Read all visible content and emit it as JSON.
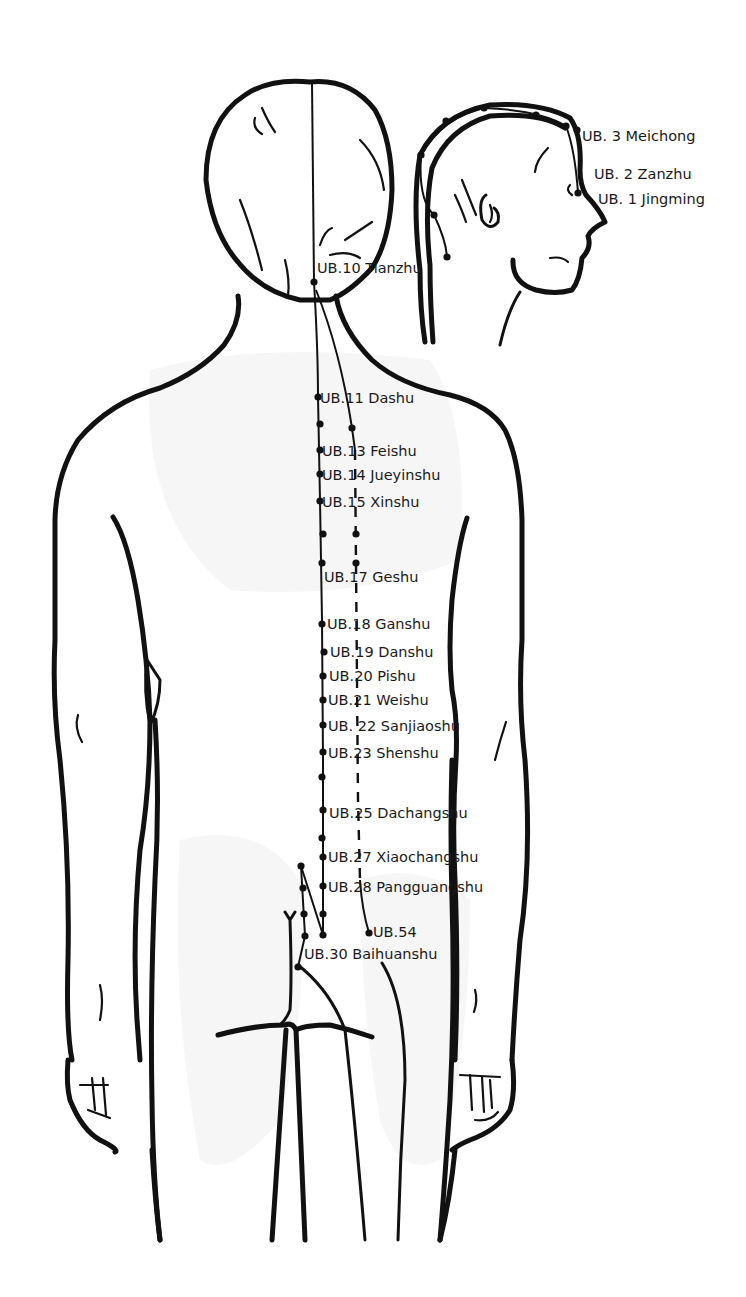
{
  "diagram": {
    "colors": {
      "line": "#111111",
      "background": "#ffffff",
      "shading": "#efefef"
    },
    "head_labels": [
      {
        "id": "ub3",
        "text": "UB. 3 Meichong",
        "x": 582,
        "y": 141,
        "px": 577,
        "py": 130
      },
      {
        "id": "ub2",
        "text": "UB. 2 Zanzhu",
        "x": 594,
        "y": 179
      },
      {
        "id": "ub1",
        "text": "UB. 1 Jingming",
        "x": 598,
        "y": 204,
        "px": 578,
        "py": 193
      }
    ],
    "back_labels": [
      {
        "id": "ub10",
        "text": "UB.10 Tianzhu",
        "x": 317,
        "y": 273,
        "px": 314,
        "py": 282
      },
      {
        "id": "ub11",
        "text": "UB.11 Dashu",
        "x": 320,
        "y": 403,
        "px": 318,
        "py": 397
      },
      {
        "id": "ub13",
        "text": "UB.13 Feishu",
        "x": 322,
        "y": 456,
        "px": 320,
        "py": 450
      },
      {
        "id": "ub14",
        "text": "UB.14 Jueyinshu",
        "x": 322,
        "y": 480,
        "px": 320,
        "py": 474
      },
      {
        "id": "ub15",
        "text": "UB.15 Xinshu",
        "x": 322,
        "y": 507,
        "px": 320,
        "py": 501
      },
      {
        "id": "ub17",
        "text": "UB.17 Geshu",
        "x": 324,
        "y": 582,
        "px": 322,
        "py": 563
      },
      {
        "id": "ub18",
        "text": "UB.18 Ganshu",
        "x": 327,
        "y": 629,
        "px": 322,
        "py": 624
      },
      {
        "id": "ub19",
        "text": "UB.19 Danshu",
        "x": 330,
        "y": 657,
        "px": 324,
        "py": 652
      },
      {
        "id": "ub20",
        "text": "UB.20 Pishu",
        "x": 329,
        "y": 681,
        "px": 323,
        "py": 676
      },
      {
        "id": "ub21",
        "text": "UB.21 Weishu",
        "x": 328,
        "y": 705,
        "px": 323,
        "py": 700
      },
      {
        "id": "ub22",
        "text": "UB. 22 Sanjiaoshu",
        "x": 328,
        "y": 731,
        "px": 323,
        "py": 725
      },
      {
        "id": "ub23",
        "text": "UB.23 Shenshu",
        "x": 328,
        "y": 758,
        "px": 323,
        "py": 752
      },
      {
        "id": "ub25",
        "text": "UB.25  Dachangshu",
        "x": 329,
        "y": 818,
        "px": 323,
        "py": 810
      },
      {
        "id": "ub27",
        "text": "UB.27 Xiaochangshu",
        "x": 328,
        "y": 862,
        "px": 323,
        "py": 857
      },
      {
        "id": "ub28",
        "text": "UB.28 Pangguangshu",
        "x": 328,
        "y": 892,
        "px": 323,
        "py": 886
      },
      {
        "id": "ub54",
        "text": "UB.54",
        "x": 373,
        "y": 937,
        "px": 369,
        "py": 933
      },
      {
        "id": "ub30",
        "text": "UB.30 Baihuanshu",
        "x": 304,
        "y": 959,
        "px": 298,
        "py": 967
      }
    ],
    "extra_points": {
      "inner_line": [
        [
          320,
          424
        ],
        [
          323,
          534
        ],
        [
          322,
          777
        ],
        [
          322,
          838
        ],
        [
          323,
          914
        ],
        [
          323,
          935
        ]
      ],
      "outer_line": [
        [
          352,
          428
        ],
        [
          356,
          534
        ],
        [
          356,
          563
        ]
      ],
      "sacral_line": [
        [
          301,
          866
        ],
        [
          303,
          888
        ],
        [
          304,
          914
        ],
        [
          305,
          936
        ]
      ],
      "head_line": [
        [
          421,
          155
        ],
        [
          446,
          121
        ],
        [
          484,
          108
        ],
        [
          536,
          115
        ],
        [
          566,
          126
        ],
        [
          434,
          215
        ],
        [
          447,
          257
        ]
      ]
    }
  }
}
